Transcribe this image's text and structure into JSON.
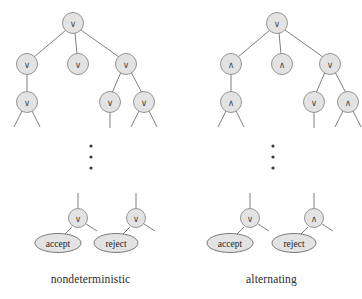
{
  "figure": {
    "background_color": "#ffffff",
    "node_fill_color": "#e3e3e3",
    "node_stroke_color": "#8a8a8a",
    "edge_color": "#6f6f6f",
    "symbols": {
      "or": "∨",
      "and": "∧"
    },
    "ellipsis_label": "vertical-ellipsis"
  },
  "panels": [
    {
      "id": "nondeterministic",
      "caption": "nondeterministic",
      "top_tree": {
        "levels": [
          {
            "level": 1,
            "nodes": [
              {
                "id": "n-root",
                "symbol": "∨",
                "x": 73,
                "y": 23
              }
            ]
          },
          {
            "level": 2,
            "nodes": [
              {
                "id": "n-l",
                "symbol": "∨",
                "x": 27,
                "y": 64
              },
              {
                "id": "n-m",
                "symbol": "∨",
                "x": 78,
                "y": 64
              },
              {
                "id": "n-r",
                "symbol": "∨",
                "x": 126,
                "y": 64
              }
            ]
          },
          {
            "level": 3,
            "nodes": [
              {
                "id": "n-l-c",
                "symbol": "∨",
                "x": 27,
                "y": 102
              },
              {
                "id": "n-r-c1",
                "symbol": "∨",
                "x": 110,
                "y": 102
              },
              {
                "id": "n-r-c2",
                "symbol": "∨",
                "x": 144,
                "y": 102
              }
            ]
          }
        ]
      },
      "bottom_nodes": [
        {
          "id": "accept-node",
          "symbol": "∨",
          "x": 78,
          "y": 218,
          "leaf": "accept",
          "leaf_x": 58,
          "leaf_y": 243
        },
        {
          "id": "reject-node",
          "symbol": "∨",
          "x": 136,
          "y": 218,
          "leaf": "reject",
          "leaf_x": 116,
          "leaf_y": 243
        }
      ],
      "ellipsis_x": 91,
      "ellipsis_ys": [
        146,
        157,
        168
      ]
    },
    {
      "id": "alternating",
      "caption": "alternating",
      "top_tree": {
        "levels": [
          {
            "level": 1,
            "nodes": [
              {
                "id": "a-root",
                "symbol": "∨",
                "x": 277,
                "y": 23
              }
            ]
          },
          {
            "level": 2,
            "nodes": [
              {
                "id": "a-l",
                "symbol": "∧",
                "x": 231,
                "y": 64
              },
              {
                "id": "a-m",
                "symbol": "∧",
                "x": 282,
                "y": 64
              },
              {
                "id": "a-r",
                "symbol": "∨",
                "x": 330,
                "y": 64
              }
            ]
          },
          {
            "level": 3,
            "nodes": [
              {
                "id": "a-l-c",
                "symbol": "∧",
                "x": 231,
                "y": 102
              },
              {
                "id": "a-r-c1",
                "symbol": "∨",
                "x": 314,
                "y": 102
              },
              {
                "id": "a-r-c2",
                "symbol": "∧",
                "x": 348,
                "y": 102
              }
            ]
          }
        ]
      },
      "bottom_nodes": [
        {
          "id": "accept-node",
          "symbol": "∨",
          "x": 250,
          "y": 218,
          "leaf": "accept",
          "leaf_x": 230,
          "leaf_y": 243
        },
        {
          "id": "reject-node",
          "symbol": "∧",
          "x": 314,
          "y": 218,
          "leaf": "reject",
          "leaf_x": 294,
          "leaf_y": 243
        }
      ],
      "ellipsis_x": 273,
      "ellipsis_ys": [
        146,
        157,
        168
      ]
    }
  ],
  "captions": {
    "left": "nondeterministic",
    "right": "alternating"
  },
  "leaf_labels": {
    "accept": "accept",
    "reject": "reject"
  }
}
